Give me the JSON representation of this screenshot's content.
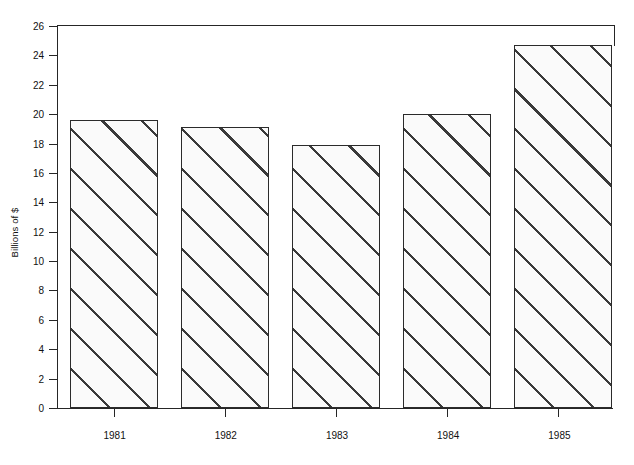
{
  "chart_data": {
    "type": "bar",
    "title": "",
    "subtitle": "",
    "xlabel": "",
    "ylabel": "Billions of $",
    "categories": [
      "1981",
      "1982",
      "1983",
      "1984",
      "1985"
    ],
    "values": [
      19.6,
      19.1,
      17.9,
      20.0,
      24.7
    ],
    "series": [
      {
        "name": "Billions of $",
        "values": [
          19.6,
          19.1,
          17.9,
          20.0,
          24.7
        ]
      }
    ],
    "ylim": [
      0,
      26
    ],
    "ytick_labels": [
      "0",
      "2",
      "4",
      "6",
      "8",
      "10",
      "12",
      "14",
      "16",
      "18",
      "20",
      "22",
      "24",
      "26"
    ],
    "ytick_values": [
      0,
      2,
      4,
      6,
      8,
      10,
      12,
      14,
      16,
      18,
      20,
      22,
      24,
      26
    ],
    "grid": false,
    "legend": false,
    "legend_position": "none",
    "bar_fill": "#fafafa",
    "bar_edge_color": "#2b2b2b",
    "hatch": "diagonal-45",
    "axis_color": "#262626",
    "background": "#ffffff"
  }
}
